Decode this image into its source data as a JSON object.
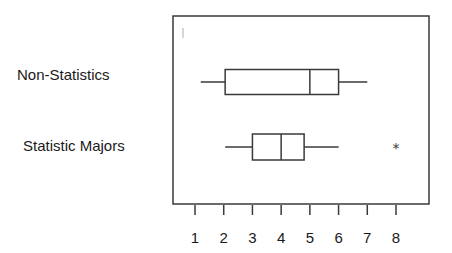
{
  "chart_data": {
    "type": "boxplot",
    "orientation": "horizontal",
    "title": "",
    "xlabel": "",
    "ylabel": "",
    "x_ticks": [
      1,
      2,
      3,
      4,
      5,
      6,
      7,
      8
    ],
    "xlim": [
      0.2,
      9.2
    ],
    "grid": false,
    "legend": null,
    "series": [
      {
        "name": "Non-Statistics",
        "whisker_low": 1.2,
        "q1": 2.05,
        "median": 5,
        "q3": 6,
        "whisker_high": 7,
        "outliers": []
      },
      {
        "name": "Statistic Majors",
        "whisker_low": 2.05,
        "q1": 3,
        "median": 4,
        "q3": 4.8,
        "whisker_high": 6,
        "outliers": [
          8
        ]
      }
    ],
    "outlier_marker": "*"
  },
  "labels": {
    "category_1": "Non-Statistics",
    "category_2": "Statistic Majors",
    "outlier_symbol": "*"
  },
  "colors": {
    "line": "#3a3a3a",
    "background": "#ffffff"
  }
}
